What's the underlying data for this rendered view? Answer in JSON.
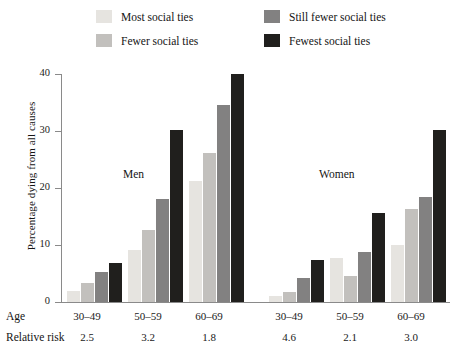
{
  "legend": {
    "items": [
      {
        "label": "Most social ties",
        "color": "#e6e4e0"
      },
      {
        "label": "Fewer social ties",
        "color": "#c2c0bd"
      },
      {
        "label": "Still fewer social ties",
        "color": "#828181"
      },
      {
        "label": "Fewest social ties",
        "color": "#201f1d"
      }
    ]
  },
  "axes": {
    "ylabel": "Percentage dying from all causes",
    "yticks": [
      "0",
      "10",
      "20",
      "30",
      "40"
    ]
  },
  "panels": [
    {
      "name": "Men"
    },
    {
      "name": "Women"
    }
  ],
  "table": {
    "age_row_label": "Age",
    "risk_row_label": "Relative risk",
    "age_values": [
      "30–49",
      "50–59",
      "60–69",
      "30–49",
      "50–59",
      "60–69"
    ],
    "risk_values": [
      "2.5",
      "3.2",
      "1.8",
      "4.6",
      "2.1",
      "3.0"
    ]
  },
  "chart_data": {
    "type": "bar",
    "title": "",
    "xlabel": "Age",
    "ylabel": "Percentage dying from all causes",
    "ylim": [
      0,
      40
    ],
    "yticks": [
      0,
      10,
      20,
      30,
      40
    ],
    "grid": false,
    "legend_position": "top",
    "categories": [
      "30–49",
      "50–59",
      "60–69",
      "30–49",
      "50–59",
      "60–69"
    ],
    "panel_of_category": [
      "Men",
      "Men",
      "Men",
      "Women",
      "Women",
      "Women"
    ],
    "relative_risk": [
      2.5,
      3.2,
      1.8,
      4.6,
      2.1,
      3.0
    ],
    "series": [
      {
        "name": "Most social ties",
        "color": "#e6e4e0",
        "values": [
          2.0,
          9.2,
          21.2,
          1.0,
          7.7,
          10.0
        ]
      },
      {
        "name": "Fewer social ties",
        "color": "#c2c0bd",
        "values": [
          3.3,
          12.6,
          26.2,
          1.8,
          4.6,
          16.3
        ]
      },
      {
        "name": "Still fewer social ties",
        "color": "#828181",
        "values": [
          5.3,
          18.0,
          34.5,
          4.2,
          8.7,
          18.4
        ]
      },
      {
        "name": "Fewest social ties",
        "color": "#201f1d",
        "values": [
          6.8,
          30.1,
          40.0,
          7.3,
          15.6,
          30.2
        ]
      }
    ]
  }
}
